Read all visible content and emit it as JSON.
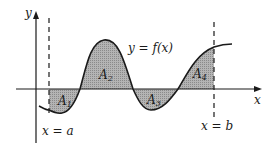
{
  "diagram": {
    "axes": {
      "x_label": "x",
      "y_label": "y"
    },
    "curve_label": "y = f(x)",
    "bounds": {
      "left_label": "x = a",
      "right_label": "x = b"
    },
    "regions": [
      {
        "name": "A",
        "sub": "1",
        "sign": "below"
      },
      {
        "name": "A",
        "sub": "2",
        "sign": "above"
      },
      {
        "name": "A",
        "sub": "3",
        "sign": "below"
      },
      {
        "name": "A",
        "sub": "4",
        "sign": "above"
      }
    ],
    "colors": {
      "ink": "#1a1a1a",
      "shade": "#a8a8a8"
    }
  }
}
